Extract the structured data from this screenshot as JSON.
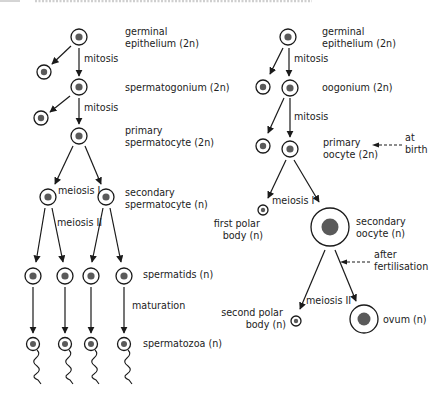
{
  "diagram": {
    "male": {
      "labels": {
        "germinal": [
          "germinal",
          "epithelium (2n)"
        ],
        "spermatogonium": "spermatogonium (2n)",
        "primary": [
          "primary",
          "spermatocyte (2n)"
        ],
        "secondary": [
          "secondary",
          "spermatocyte (n)"
        ],
        "spermatids": "spermatids (n)",
        "spermatozoa": "spermatozoa (n)"
      },
      "processes": {
        "mitosis_1": "mitosis",
        "mitosis_2": "mitosis",
        "meiosis_1": "meiosis I",
        "meiosis_2": "meiosis II",
        "maturation": "maturation"
      }
    },
    "female": {
      "labels": {
        "germinal": [
          "germinal",
          "epithelium (2n)"
        ],
        "oogonium": "oogonium (2n)",
        "primary": [
          "primary",
          "oocyte (2n)"
        ],
        "at_birth": [
          "at",
          "birth"
        ],
        "first_polar": [
          "first polar",
          "body (n)"
        ],
        "secondary": [
          "secondary",
          "oocyte (n)"
        ],
        "after_fert": [
          "after",
          "fertilisation"
        ],
        "second_polar": [
          "second polar",
          "body (n)"
        ],
        "ovum": "ovum (n)"
      },
      "processes": {
        "mitosis_1": "mitosis",
        "mitosis_2": "mitosis",
        "meiosis_1": "meiosis I",
        "meiosis_2": "meiosis II"
      }
    },
    "colors": {
      "line": "#1a1a1a",
      "nucleus": "#5a5a5a",
      "text": "#222222",
      "background": "#ffffff"
    }
  }
}
